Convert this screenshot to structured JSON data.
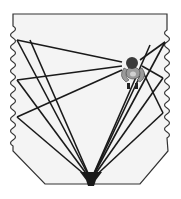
{
  "diagram": {
    "type": "ray-reflection-diagram",
    "colors": {
      "background": "#ffffff",
      "room_fill": "#f4f4f4",
      "outline": "#333333",
      "rays": "#1a1a1a",
      "source": "#1a1a1a",
      "character_head": "#3a3a3a",
      "character_body": "#9a9a9a",
      "character_feet": "#222222"
    },
    "source": {
      "x": 91,
      "y": 180,
      "label_icon": "speaker-funnel-icon"
    },
    "listener": {
      "x": 132,
      "y": 72,
      "label_icon": "creature-listener-icon"
    },
    "left_reflection_points": [
      {
        "x": 17,
        "y": 40
      },
      {
        "x": 17,
        "y": 80
      },
      {
        "x": 17,
        "y": 117
      }
    ],
    "right_reflection_points": [
      {
        "x": 165,
        "y": 42
      },
      {
        "x": 163,
        "y": 78
      },
      {
        "x": 163,
        "y": 113
      }
    ]
  }
}
